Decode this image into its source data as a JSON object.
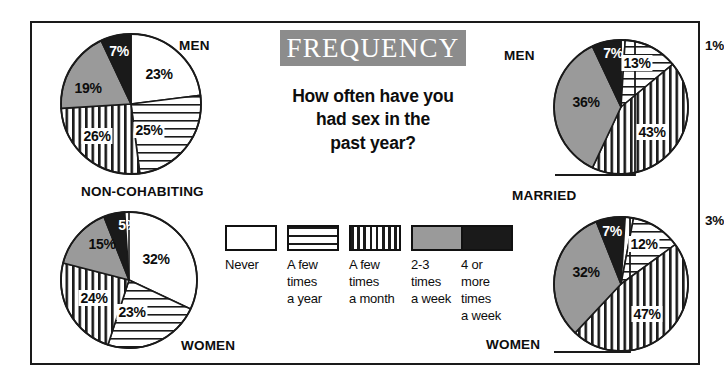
{
  "banner": {
    "title": "FREQUENCY"
  },
  "question": {
    "line1": "How often have you",
    "line2": "had sex in the",
    "line3": "past year?"
  },
  "legend": {
    "items": [
      {
        "id": "never",
        "label": "Never",
        "pattern": "solid-white",
        "color": "#ffffff"
      },
      {
        "id": "few-year",
        "label": "A few\ntimes\na year",
        "pattern": "h-stripes",
        "color": "#ffffff"
      },
      {
        "id": "few-month",
        "label": "A few\ntimes\na month",
        "pattern": "v-stripes",
        "color": "#ffffff"
      },
      {
        "id": "2-3-week",
        "label": "2-3\ntimes\na week",
        "pattern": "solid-gray",
        "color": "#9a9a9a"
      },
      {
        "id": "4-more-week",
        "label": "4 or\nmore\ntimes\na week",
        "pattern": "solid-black",
        "color": "#1a1a1a"
      }
    ]
  },
  "charts": [
    {
      "id": "non-cohabiting-men",
      "group_label": "MEN",
      "status_label": "NON-COHABITING",
      "slices": [
        {
          "category": "Never",
          "value": 23,
          "display": "23%",
          "pattern": "solid-white"
        },
        {
          "category": "A few times a year",
          "value": 25,
          "display": "25%",
          "pattern": "h-stripes"
        },
        {
          "category": "A few times a month",
          "value": 26,
          "display": "26%",
          "pattern": "v-stripes"
        },
        {
          "category": "2-3 times a week",
          "value": 19,
          "display": "19%",
          "pattern": "solid-gray"
        },
        {
          "category": "4 or more times a week",
          "value": 7,
          "display": "7%",
          "pattern": "solid-black"
        }
      ]
    },
    {
      "id": "non-cohabiting-women",
      "group_label": "WOMEN",
      "status_label": "NON-COHABITING",
      "slices": [
        {
          "category": "Never",
          "value": 32,
          "display": "32%",
          "pattern": "solid-white"
        },
        {
          "category": "A few times a year",
          "value": 23,
          "display": "23%",
          "pattern": "h-stripes"
        },
        {
          "category": "A few times a month",
          "value": 24,
          "display": "24%",
          "pattern": "v-stripes"
        },
        {
          "category": "2-3 times a week",
          "value": 15,
          "display": "15%",
          "pattern": "solid-gray"
        },
        {
          "category": "4 or more times a week",
          "value": 5,
          "display": "5%",
          "pattern": "solid-black"
        }
      ]
    },
    {
      "id": "married-men",
      "group_label": "MEN",
      "status_label": "MARRIED",
      "slices": [
        {
          "category": "Never",
          "value": 1,
          "display": "1%",
          "pattern": "solid-white"
        },
        {
          "category": "A few times a year",
          "value": 13,
          "display": "13%",
          "pattern": "h-stripes"
        },
        {
          "category": "A few times a month",
          "value": 43,
          "display": "43%",
          "pattern": "v-stripes"
        },
        {
          "category": "2-3 times a week",
          "value": 36,
          "display": "36%",
          "pattern": "solid-gray"
        },
        {
          "category": "4 or more times a week",
          "value": 7,
          "display": "7%",
          "pattern": "solid-black"
        }
      ]
    },
    {
      "id": "married-women",
      "group_label": "WOMEN",
      "status_label": "MARRIED",
      "slices": [
        {
          "category": "Never",
          "value": 3,
          "display": "3%",
          "pattern": "solid-white"
        },
        {
          "category": "A few times a year",
          "value": 12,
          "display": "12%",
          "pattern": "h-stripes"
        },
        {
          "category": "A few times a month",
          "value": 47,
          "display": "47%",
          "pattern": "v-stripes"
        },
        {
          "category": "2-3 times a week",
          "value": 32,
          "display": "32%",
          "pattern": "solid-gray"
        },
        {
          "category": "4 or more times a week",
          "value": 7,
          "display": "7%",
          "pattern": "solid-black"
        }
      ]
    }
  ],
  "chart_data": {
    "type": "pie",
    "title": "FREQUENCY",
    "subtitle": "How often have you had sex in the past year?",
    "categories": [
      "Never",
      "A few times a year",
      "A few times a month",
      "2-3 times a week",
      "4 or more times a week"
    ],
    "legend_position": "center",
    "units": "percent",
    "series": [
      {
        "name": "NON-COHABITING MEN",
        "values": [
          23,
          25,
          26,
          19,
          7
        ]
      },
      {
        "name": "NON-COHABITING WOMEN",
        "values": [
          32,
          23,
          24,
          15,
          5
        ]
      },
      {
        "name": "MARRIED MEN",
        "values": [
          1,
          13,
          43,
          36,
          7
        ]
      },
      {
        "name": "MARRIED WOMEN",
        "values": [
          3,
          12,
          47,
          32,
          7
        ]
      }
    ]
  },
  "colors": {
    "banner_bg": "#8c8c8c",
    "gray_slice": "#9a9a9a",
    "black_slice": "#1a1a1a",
    "outline": "#1a1a1a"
  }
}
